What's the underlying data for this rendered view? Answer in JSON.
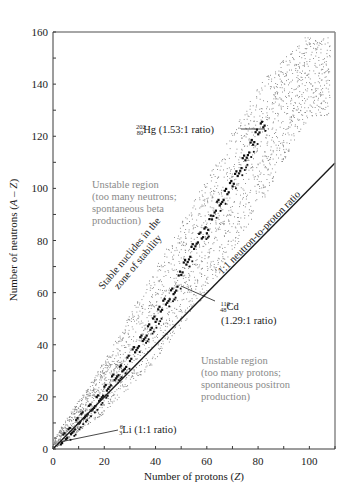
{
  "chart_data": {
    "type": "scatter",
    "title": "",
    "xlabel": "Number of protons (Z)",
    "ylabel": "Number of neutrons (A – Z)",
    "xlim": [
      0,
      110
    ],
    "ylim": [
      0,
      160
    ],
    "x_ticks": [
      0,
      20,
      40,
      60,
      80,
      100
    ],
    "y_ticks": [
      0,
      20,
      40,
      60,
      80,
      100,
      120,
      140,
      160
    ],
    "x_minor_step": 10,
    "y_minor_step": 10,
    "grid": false,
    "series": [
      {
        "name": "Stable nuclides (zone of stability)",
        "style": "black squares",
        "points_approx": [
          [
            3,
            3
          ],
          [
            5,
            5
          ],
          [
            8,
            8
          ],
          [
            10,
            11
          ],
          [
            13,
            14
          ],
          [
            16,
            17
          ],
          [
            19,
            21
          ],
          [
            22,
            25
          ],
          [
            25,
            29
          ],
          [
            28,
            32
          ],
          [
            30,
            35
          ],
          [
            33,
            40
          ],
          [
            36,
            44
          ],
          [
            40,
            50
          ],
          [
            42,
            54
          ],
          [
            45,
            58
          ],
          [
            48,
            62
          ],
          [
            50,
            68
          ],
          [
            53,
            74
          ],
          [
            56,
            80
          ],
          [
            60,
            84
          ],
          [
            63,
            92
          ],
          [
            66,
            96
          ],
          [
            70,
            102
          ],
          [
            73,
            108
          ],
          [
            76,
            114
          ],
          [
            80,
            122
          ],
          [
            83,
            126
          ]
        ]
      },
      {
        "name": "Known radioactive nuclides (dotted band)",
        "style": "gray dots",
        "band_approx": [
          {
            "z": 0,
            "n_low": 0,
            "n_high": 4
          },
          {
            "z": 20,
            "n_low": 14,
            "n_high": 34
          },
          {
            "z": 40,
            "n_low": 34,
            "n_high": 70
          },
          {
            "z": 60,
            "n_low": 60,
            "n_high": 104
          },
          {
            "z": 80,
            "n_low": 92,
            "n_high": 140
          },
          {
            "z": 100,
            "n_low": 128,
            "n_high": 160
          }
        ]
      },
      {
        "name": "1:1 neutron-to-proton ratio",
        "style": "line",
        "x": [
          0,
          110
        ],
        "y": [
          0,
          110
        ]
      }
    ],
    "annotations": [
      {
        "text_mass": "202",
        "text_atomic": "80",
        "symbol": "Hg",
        "label": "(1.53:1 ratio)",
        "point": [
          80,
          122
        ]
      },
      {
        "text_mass": "110",
        "text_atomic": "48",
        "symbol": "Cd",
        "label": "(1.29:1 ratio)",
        "point": [
          48,
          62
        ]
      },
      {
        "text_mass": "6",
        "text_atomic": "3",
        "symbol": "Li",
        "label": "(1:1 ratio)",
        "point": [
          3,
          3
        ]
      },
      {
        "text": "1:1 neutron-to-proton ratio",
        "rotated": true
      },
      {
        "text": [
          "Stable nuclides in the",
          "zone of stability"
        ],
        "rotated": true
      },
      {
        "text": [
          "Unstable region",
          "(too many neutrons;",
          "spontaneous beta",
          "production)"
        ],
        "color": "#8a8a8a"
      },
      {
        "text": [
          "Unstable region",
          "(too many protons;",
          "spontaneous positron",
          "production)"
        ],
        "color": "#8a8a8a"
      }
    ],
    "legend": null
  },
  "labels": {
    "xlabel": "Number of protons (",
    "xlabel_var": "Z",
    "xlabel_end": ")",
    "ylabel": "Number of neutrons (",
    "ylabel_var": "A – Z",
    "ylabel_end": ")",
    "hg": {
      "mass": "202",
      "z": "80",
      "sym": "Hg",
      "ratio": " (1.53:1 ratio)"
    },
    "cd": {
      "mass": "110",
      "z": "48",
      "sym": "Cd",
      "ratio": "(1.29:1 ratio)"
    },
    "li": {
      "mass": "6",
      "z": "3",
      "sym": "Li",
      "ratio": " (1:1 ratio)"
    },
    "line_label": "1:1 neutron-to-proton ratio",
    "stable_1": "Stable nuclides in the",
    "stable_2": "zone of stability",
    "neutron_region": [
      "Unstable region",
      "(too many neutrons;",
      "spontaneous beta",
      "production)"
    ],
    "proton_region": [
      "Unstable region",
      "(too many protons;",
      "spontaneous positron",
      "production)"
    ]
  },
  "colors": {
    "axis": "#3a3a3a",
    "frame": "#888888",
    "stable": "#111111",
    "dots": "#7a7a7a",
    "region_text": "#8a8a8a"
  }
}
